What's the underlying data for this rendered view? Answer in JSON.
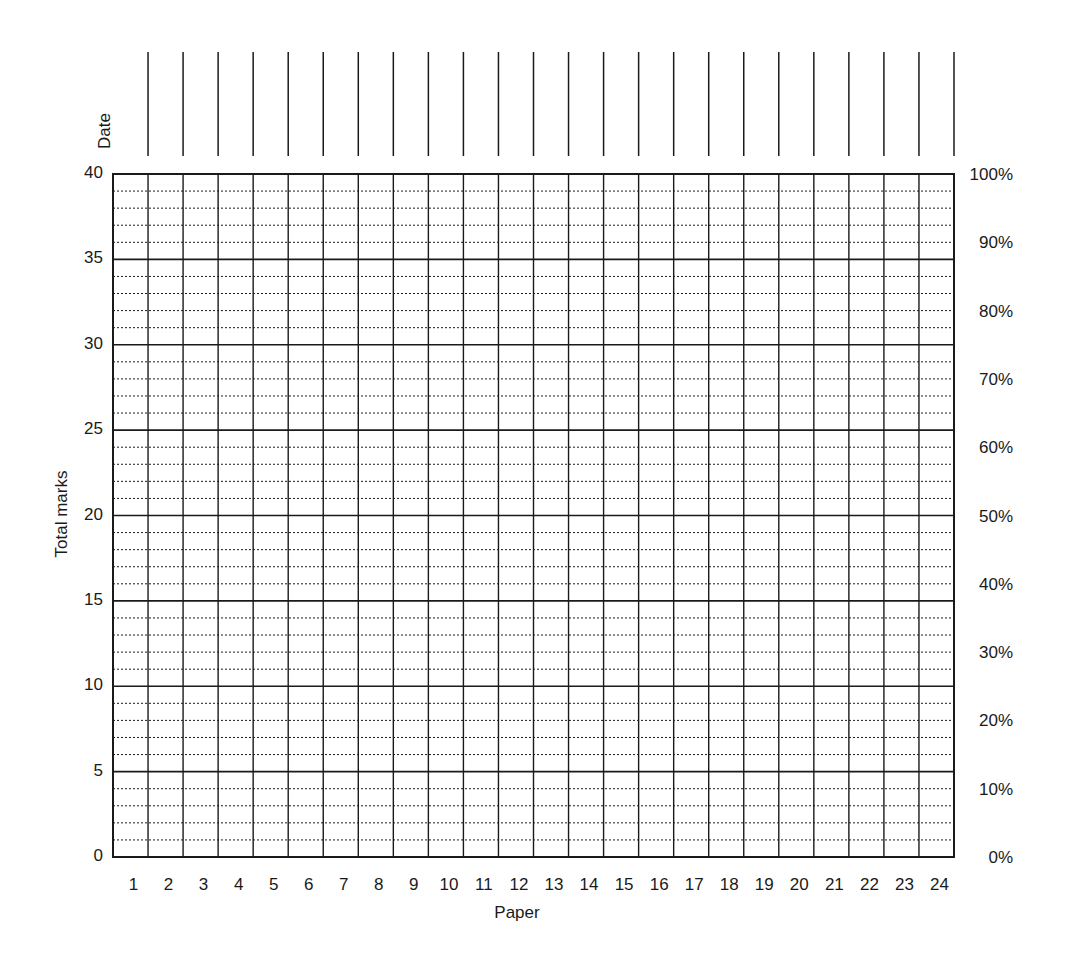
{
  "chart_data": {
    "type": "table",
    "title": "",
    "xlabel": "Paper",
    "ylabel": "Total marks",
    "y2label": "",
    "header_row_label": "Date",
    "categories": [
      "1",
      "2",
      "3",
      "4",
      "5",
      "6",
      "7",
      "8",
      "9",
      "10",
      "11",
      "12",
      "13",
      "14",
      "15",
      "16",
      "17",
      "18",
      "19",
      "20",
      "21",
      "22",
      "23",
      "24"
    ],
    "x": [
      1,
      2,
      3,
      4,
      5,
      6,
      7,
      8,
      9,
      10,
      11,
      12,
      13,
      14,
      15,
      16,
      17,
      18,
      19,
      20,
      21,
      22,
      23,
      24
    ],
    "series": [],
    "ylim": [
      0,
      40
    ],
    "y_ticks": [
      0,
      5,
      10,
      15,
      20,
      25,
      30,
      35,
      40
    ],
    "y_minor_step": 1,
    "y2_ticks": [
      "0%",
      "10%",
      "20%",
      "30%",
      "40%",
      "50%",
      "60%",
      "70%",
      "80%",
      "90%",
      "100%"
    ],
    "y2_tick_values": [
      0,
      4,
      8,
      12,
      16,
      20,
      24,
      28,
      32,
      36,
      40
    ],
    "grid": {
      "major": "solid every 5 marks",
      "minor": "dotted every 1 mark",
      "vertical": "solid per paper"
    },
    "legend": null,
    "note": "Blank progress-tracking grid; no data points plotted"
  },
  "labels": {
    "date": "Date",
    "y_axis": "Total marks",
    "x_axis": "Paper"
  },
  "colors": {
    "line": "#1a1a1a",
    "background": "#ffffff"
  }
}
